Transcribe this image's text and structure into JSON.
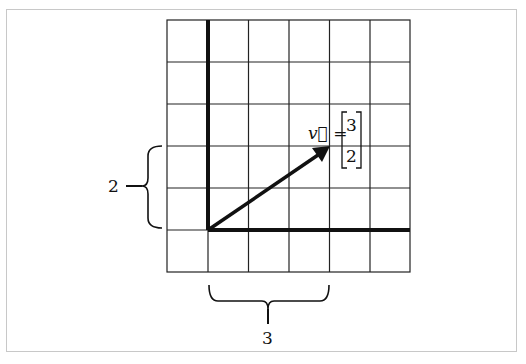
{
  "diagram": {
    "grid": {
      "columns": 6,
      "rows": 6
    },
    "vector": {
      "name": "v",
      "label_lhs": "v⃗ =",
      "components": [
        "3",
        "2"
      ]
    },
    "brace_vertical_label": "2",
    "brace_horizontal_label": "3",
    "colors": {
      "axis": "#111111",
      "grid": "#222222",
      "frame": "#c8c8c8"
    }
  }
}
